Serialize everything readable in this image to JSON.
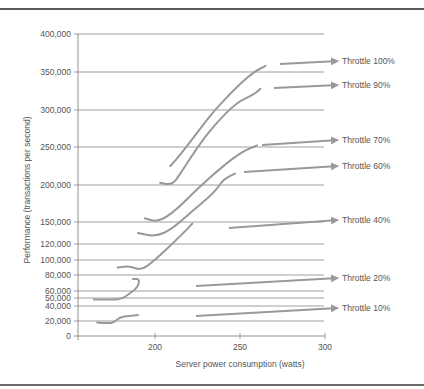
{
  "chart_data": {
    "type": "line",
    "title": "",
    "xlabel": "Server power consumption (watts)",
    "ylabel": "Performance (transactions per second)",
    "xlim": [
      160,
      300
    ],
    "ylim": [
      0,
      400000
    ],
    "x_ticks": [
      200,
      250,
      300
    ],
    "y_ticks": [
      0,
      20000,
      40000,
      50000,
      60000,
      80000,
      100000,
      120000,
      150000,
      200000,
      250000,
      300000,
      350000,
      400000
    ],
    "y_tick_labels": [
      "0",
      "20,000",
      "40,000",
      "50,000",
      "60,000",
      "80,000",
      "100,000",
      "120,000",
      "150,000",
      "200,000",
      "250,000",
      "300,000",
      "350,000",
      "400,000"
    ],
    "grid": true,
    "legend_position": "right (arrow annotations)",
    "series": [
      {
        "name": "Throttle 100%",
        "points": [
          [
            209,
            225000
          ],
          [
            215,
            240000
          ],
          [
            225,
            270000
          ],
          [
            235,
            300000
          ],
          [
            248,
            330000
          ],
          [
            258,
            350000
          ],
          [
            265,
            358000
          ]
        ]
      },
      {
        "name": "Throttle 90%",
        "points": [
          [
            203,
            203000
          ],
          [
            210,
            200000
          ],
          [
            215,
            215000
          ],
          [
            225,
            250000
          ],
          [
            235,
            280000
          ],
          [
            248,
            310000
          ],
          [
            258,
            320000
          ],
          [
            262,
            328000
          ]
        ]
      },
      {
        "name": "Throttle 70%",
        "points": [
          [
            194,
            155000
          ],
          [
            202,
            150000
          ],
          [
            212,
            165000
          ],
          [
            225,
            195000
          ],
          [
            240,
            225000
          ],
          [
            252,
            245000
          ],
          [
            260,
            252000
          ]
        ]
      },
      {
        "name": "Throttle 60%",
        "points": [
          [
            190,
            135000
          ],
          [
            200,
            130000
          ],
          [
            210,
            140000
          ],
          [
            222,
            165000
          ],
          [
            235,
            190000
          ],
          [
            240,
            207000
          ],
          [
            247,
            215000
          ]
        ]
      },
      {
        "name": "Throttle 40%",
        "points": [
          [
            178,
            90000
          ],
          [
            185,
            92000
          ],
          [
            192,
            86000
          ],
          [
            200,
            100000
          ],
          [
            210,
            120000
          ],
          [
            218,
            138000
          ],
          [
            222,
            148000
          ]
        ]
      },
      {
        "name": "Throttle 20%",
        "points": [
          [
            164,
            48000
          ],
          [
            172,
            48000
          ],
          [
            180,
            48000
          ],
          [
            186,
            58000
          ],
          [
            190,
            65000
          ],
          [
            191,
            75000
          ],
          [
            187,
            75000
          ]
        ]
      },
      {
        "name": "Throttle 10%",
        "points": [
          [
            166,
            18000
          ],
          [
            172,
            17000
          ],
          [
            176,
            18000
          ],
          [
            179,
            25000
          ],
          [
            185,
            27000
          ],
          [
            190,
            28000
          ]
        ]
      }
    ]
  },
  "axes": {
    "x_label": "Server power consumption (watts)",
    "y_label": "Performance (transactions per second)",
    "x_ticks": [
      "200",
      "250",
      "300"
    ],
    "y_ticks": [
      "400,000",
      "350,000",
      "300,000",
      "250,000",
      "200,000",
      "150,000",
      "120,000",
      "100,000",
      "80,000",
      "60,000",
      "50,000",
      "40,000",
      "20,000",
      "0"
    ]
  },
  "legend": {
    "items": [
      "Throttle 100%",
      "Throttle 90%",
      "Throttle 70%",
      "Throttle 60%",
      "Throttle 40%",
      "Throttle 20%",
      "Throttle 10%"
    ]
  },
  "colors": {
    "curve": "#999999",
    "grid": "#777777",
    "text": "#555555",
    "frame": "#5a5a5a"
  }
}
